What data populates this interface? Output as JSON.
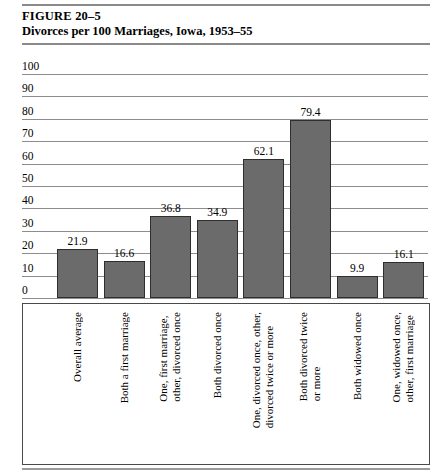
{
  "figure": {
    "number": "FIGURE  20–5",
    "title": "Divorces per 100 Marriages, Iowa, 1953–55"
  },
  "chart_data": {
    "type": "bar",
    "title": "Divorces per 100 Marriages, Iowa, 1953–55",
    "xlabel": "",
    "ylabel": "",
    "ylim": [
      0,
      100
    ],
    "yticks": [
      "100",
      "90",
      "80",
      "70",
      "60",
      "50",
      "40",
      "30",
      "20",
      "10",
      "0"
    ],
    "grid": true,
    "legend": "none",
    "bar_color": "#6b6b6b",
    "categories": [
      "Overall average",
      "Both a first marriage",
      "One, first marriage, other, divorced once",
      "Both divorced once",
      "One, divorced once, other, divorced twice or more",
      "Both divorced twice or more",
      "Both widowed once",
      "One, widowed once, other, first marriage"
    ],
    "category_lines": [
      [
        "Overall average"
      ],
      [
        "Both a first marriage"
      ],
      [
        "One, first marriage,",
        "other, divorced once"
      ],
      [
        "Both divorced once"
      ],
      [
        "One, divorced once, other,",
        "divorced twice or more"
      ],
      [
        "Both divorced twice",
        "or more"
      ],
      [
        "Both widowed once"
      ],
      [
        "One, widowed once,",
        "other, first marriage"
      ]
    ],
    "values": [
      21.9,
      16.6,
      36.8,
      34.9,
      62.1,
      79.4,
      9.9,
      16.1
    ],
    "value_labels": [
      "21.9",
      "16.6",
      "36.8",
      "34.9",
      "62.1",
      "79.4",
      "9.9",
      "16.1"
    ]
  }
}
